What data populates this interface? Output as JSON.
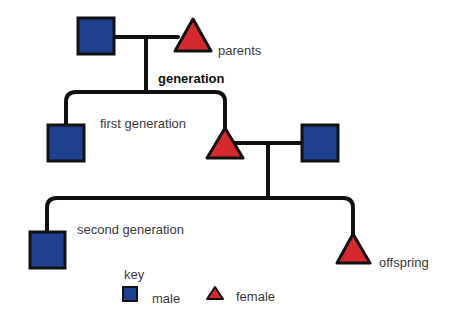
{
  "diagram": {
    "type": "pedigree",
    "colors": {
      "male": "#1f3f8f",
      "female": "#d42a2f",
      "line": "#111111",
      "text": "#3a3a3a"
    },
    "labels": {
      "parents": "parents",
      "generation": "generation",
      "first_generation": "first generation",
      "second_generation": "second generation",
      "offspring": "offspring"
    },
    "key": {
      "title": "key",
      "items": [
        {
          "symbol": "square",
          "label": "male"
        },
        {
          "symbol": "triangle",
          "label": "female"
        }
      ]
    },
    "nodes": [
      {
        "id": "parent-male",
        "sex": "male",
        "generation": "parents"
      },
      {
        "id": "parent-female",
        "sex": "female",
        "generation": "parents"
      },
      {
        "id": "gen1-male",
        "sex": "male",
        "generation": "first generation"
      },
      {
        "id": "gen1-female",
        "sex": "female",
        "generation": "first generation"
      },
      {
        "id": "gen1-spouse-male",
        "sex": "male",
        "generation": "first generation"
      },
      {
        "id": "gen2-male",
        "sex": "male",
        "generation": "second generation"
      },
      {
        "id": "gen2-female",
        "sex": "female",
        "generation": "second generation"
      }
    ]
  }
}
